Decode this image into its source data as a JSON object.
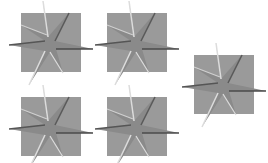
{
  "canvas": {
    "width": 268,
    "height": 163,
    "background": "#ffffff"
  },
  "tiles": [
    {
      "x": 21,
      "y": 13
    },
    {
      "x": 107,
      "y": 13
    },
    {
      "x": 194,
      "y": 55
    },
    {
      "x": 21,
      "y": 97
    },
    {
      "x": 107,
      "y": 97
    }
  ],
  "colors": {
    "square": "#9a9a9a",
    "star": "#8c8c8c",
    "highlight": "#d8d8d8",
    "shadow": "#5a5a5a"
  },
  "icon": "embossed-star-icon"
}
